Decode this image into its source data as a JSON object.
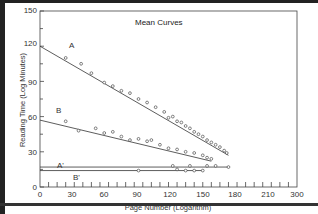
{
  "chart_data": {
    "type": "scatter",
    "title": "Mean Curves",
    "xlabel": "Page Number (Logarithm)",
    "ylabel": "Reading Time (Log Minutes)",
    "xlim": [
      0,
      300
    ],
    "ylim": [
      0,
      150
    ],
    "x_ticks": [
      0,
      30,
      60,
      90,
      120,
      150,
      180,
      210,
      300
    ],
    "y_ticks": [
      0,
      30,
      60,
      90,
      120,
      150
    ],
    "grid": false,
    "legend": "none (inline curve labels)",
    "series": [
      {
        "name": "A",
        "fit_line": [
          [
            0,
            120
          ],
          [
            220,
            27
          ]
        ],
        "points": [
          [
            30,
            110
          ],
          [
            48,
            105
          ],
          [
            60,
            97
          ],
          [
            75,
            89
          ],
          [
            85,
            86
          ],
          [
            95,
            82
          ],
          [
            105,
            80
          ],
          [
            115,
            75
          ],
          [
            125,
            72
          ],
          [
            135,
            68
          ],
          [
            145,
            64
          ],
          [
            150,
            59
          ],
          [
            155,
            60
          ],
          [
            160,
            56
          ],
          [
            165,
            55
          ],
          [
            170,
            52
          ],
          [
            175,
            50
          ],
          [
            180,
            47
          ],
          [
            185,
            45
          ],
          [
            190,
            43
          ],
          [
            195,
            40
          ],
          [
            200,
            38
          ],
          [
            205,
            36
          ],
          [
            210,
            34
          ],
          [
            215,
            31
          ],
          [
            218,
            29
          ]
        ]
      },
      {
        "name": "B",
        "fit_line": [
          [
            0,
            57
          ],
          [
            200,
            22
          ]
        ],
        "points": [
          [
            30,
            56
          ],
          [
            45,
            48
          ],
          [
            65,
            50
          ],
          [
            75,
            46
          ],
          [
            85,
            47
          ],
          [
            95,
            43
          ],
          [
            105,
            40
          ],
          [
            115,
            41
          ],
          [
            125,
            39
          ],
          [
            130,
            40
          ],
          [
            140,
            36
          ],
          [
            150,
            33
          ],
          [
            160,
            32
          ],
          [
            170,
            30
          ],
          [
            180,
            29
          ],
          [
            190,
            27
          ],
          [
            195,
            25
          ],
          [
            200,
            24
          ]
        ]
      },
      {
        "name": "A'",
        "fit_line": [
          [
            0,
            17
          ],
          [
            220,
            17
          ]
        ],
        "points": [
          [
            155,
            18
          ],
          [
            175,
            18
          ],
          [
            195,
            18
          ],
          [
            205,
            18
          ],
          [
            220,
            17
          ]
        ]
      },
      {
        "name": "B'",
        "fit_line": [
          [
            0,
            14
          ],
          [
            190,
            14
          ]
        ],
        "points": [
          [
            115,
            14
          ],
          [
            160,
            15
          ],
          [
            170,
            14
          ],
          [
            180,
            14
          ],
          [
            190,
            14
          ]
        ]
      }
    ]
  },
  "labels": {
    "title": "Mean Curves",
    "xlabel": "Page Number (Logarithm)",
    "ylabel": "Reading Time (Log Minutes)",
    "curve_a": "A",
    "curve_b": "B",
    "curve_a_prime": "A'",
    "curve_b_prime": "B'",
    "x0": "0",
    "x30": "30",
    "x60": "60",
    "x90": "90",
    "x120": "120",
    "x150": "150",
    "x180": "180",
    "x210": "210",
    "x300": "300",
    "y0": "0",
    "y30": "30",
    "y60": "60",
    "y90": "90",
    "y120": "120",
    "y150": "150"
  }
}
